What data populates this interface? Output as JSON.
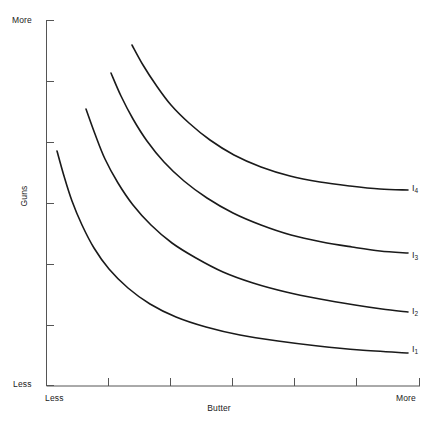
{
  "chart_data": {
    "type": "line",
    "title": "",
    "subtitle": "",
    "xlabel": "Butter",
    "ylabel": "Guns",
    "x_axis": {
      "label": "Butter",
      "low_tick_label": "Less",
      "high_tick_label": "More",
      "tick_positions": [
        0,
        1,
        2,
        3,
        4,
        5,
        6
      ],
      "tick_labels": [
        "",
        "",
        "",
        "",
        "",
        "",
        ""
      ],
      "range_min_label": "Less",
      "range_max_label": "More"
    },
    "y_axis": {
      "label": "Guns",
      "low_tick_label": "Less",
      "high_tick_label": "More",
      "tick_positions": [
        0,
        1,
        2,
        3,
        4,
        5,
        6
      ],
      "tick_labels": [
        "",
        "",
        "",
        "",
        "",
        "",
        ""
      ],
      "range_min_label": "Less",
      "range_max_label": "More"
    },
    "grid": false,
    "legend_position": "inline-right",
    "series": [
      {
        "name": "I1",
        "label": "I",
        "subscript": "1",
        "label_text": "I₁",
        "description": "lowest indifference curve",
        "start_point": [
          57,
          151
        ],
        "end_point": [
          408,
          353
        ],
        "points": [
          [
            57,
            151
          ],
          [
            64,
            176
          ],
          [
            72,
            201
          ],
          [
            82,
            225
          ],
          [
            94,
            248
          ],
          [
            109,
            269
          ],
          [
            128,
            288
          ],
          [
            150,
            304
          ],
          [
            176,
            317
          ],
          [
            206,
            327
          ],
          [
            240,
            335
          ],
          [
            278,
            341
          ],
          [
            318,
            346
          ],
          [
            360,
            350
          ],
          [
            408,
            353
          ]
        ]
      },
      {
        "name": "I2",
        "label": "I",
        "subscript": "2",
        "label_text": "I₂",
        "description": "second indifference curve",
        "start_point": [
          86,
          109
        ],
        "end_point": [
          408,
          312
        ],
        "points": [
          [
            86,
            109
          ],
          [
            95,
            134
          ],
          [
            105,
            159
          ],
          [
            118,
            183
          ],
          [
            133,
            205
          ],
          [
            151,
            225
          ],
          [
            172,
            243
          ],
          [
            196,
            258
          ],
          [
            223,
            272
          ],
          [
            253,
            283
          ],
          [
            286,
            292
          ],
          [
            320,
            299
          ],
          [
            355,
            305
          ],
          [
            382,
            309
          ],
          [
            408,
            312
          ]
        ]
      },
      {
        "name": "I3",
        "label": "I",
        "subscript": "3",
        "label_text": "I₃",
        "description": "third indifference curve",
        "start_point": [
          111,
          73
        ],
        "end_point": [
          408,
          253
        ],
        "points": [
          [
            111,
            73
          ],
          [
            121,
            96
          ],
          [
            133,
            119
          ],
          [
            147,
            141
          ],
          [
            164,
            162
          ],
          [
            184,
            181
          ],
          [
            207,
            198
          ],
          [
            233,
            213
          ],
          [
            261,
            225
          ],
          [
            291,
            235
          ],
          [
            322,
            242
          ],
          [
            352,
            247
          ],
          [
            380,
            251
          ],
          [
            408,
            253
          ]
        ]
      },
      {
        "name": "I4",
        "label": "I",
        "subscript": "4",
        "label_text": "I₄",
        "description": "highest indifference curve",
        "start_point": [
          132,
          45
        ],
        "end_point": [
          408,
          190
        ],
        "points": [
          [
            132,
            45
          ],
          [
            143,
            65
          ],
          [
            156,
            85
          ],
          [
            171,
            105
          ],
          [
            189,
            123
          ],
          [
            210,
            140
          ],
          [
            234,
            155
          ],
          [
            261,
            167
          ],
          [
            290,
            176
          ],
          [
            320,
            182
          ],
          [
            350,
            186
          ],
          [
            380,
            189
          ],
          [
            408,
            190
          ]
        ]
      }
    ],
    "colors": {
      "curve": "#1a1a1a",
      "axis": "#4a4a4a",
      "background": "#ffffff",
      "text": "#1a1a1a"
    }
  },
  "axes": {
    "y_more": "More",
    "y_less": "Less",
    "y_title": "Guns",
    "x_less": "Less",
    "x_more": "More",
    "x_title": "Butter"
  },
  "curve_labels": {
    "i1": "I",
    "i1_sub": "1",
    "i2": "I",
    "i2_sub": "2",
    "i3": "I",
    "i3_sub": "3",
    "i4": "I",
    "i4_sub": "4"
  }
}
